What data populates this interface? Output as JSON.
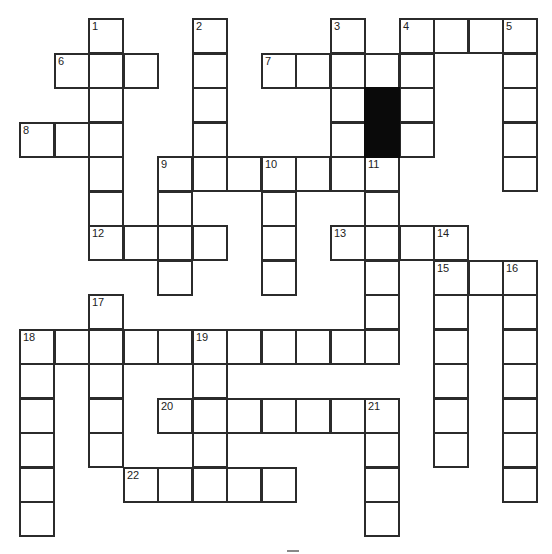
{
  "puzzle": {
    "type": "crossword",
    "grid_origin": {
      "x": 20,
      "y": 19
    },
    "cell_size": 34.5,
    "columns": 15,
    "rows": 15,
    "colors": {
      "border": "#2b2b2b",
      "block": "#0a0a0a",
      "background": "#ffffff"
    },
    "black_cells": [
      [
        2,
        10
      ],
      [
        3,
        10
      ]
    ],
    "entries": [
      {
        "number": "1",
        "direction": "down",
        "row": 0,
        "col": 2,
        "length": 7
      },
      {
        "number": "2",
        "direction": "down",
        "row": 0,
        "col": 5,
        "length": 5
      },
      {
        "number": "3",
        "direction": "down",
        "row": 0,
        "col": 9,
        "length": 4
      },
      {
        "number": "4",
        "direction": "across",
        "row": 0,
        "col": 11,
        "length": 4
      },
      {
        "number": "4",
        "direction": "down",
        "row": 0,
        "col": 11,
        "length": 4
      },
      {
        "number": "5",
        "direction": "down",
        "row": 0,
        "col": 14,
        "length": 5
      },
      {
        "number": "6",
        "direction": "across",
        "row": 1,
        "col": 1,
        "length": 3
      },
      {
        "number": "7",
        "direction": "across",
        "row": 1,
        "col": 7,
        "length": 5
      },
      {
        "number": "8",
        "direction": "across",
        "row": 3,
        "col": 0,
        "length": 3
      },
      {
        "number": "9",
        "direction": "across",
        "row": 4,
        "col": 4,
        "length": 7
      },
      {
        "number": "9",
        "direction": "down",
        "row": 4,
        "col": 4,
        "length": 4
      },
      {
        "number": "10",
        "direction": "down",
        "row": 4,
        "col": 7,
        "length": 4
      },
      {
        "number": "11",
        "direction": "down",
        "row": 4,
        "col": 10,
        "length": 6
      },
      {
        "number": "12",
        "direction": "across",
        "row": 6,
        "col": 2,
        "length": 4
      },
      {
        "number": "13",
        "direction": "across",
        "row": 6,
        "col": 9,
        "length": 4
      },
      {
        "number": "14",
        "direction": "down",
        "row": 6,
        "col": 12,
        "length": 7
      },
      {
        "number": "15",
        "direction": "across",
        "row": 7,
        "col": 12,
        "length": 3
      },
      {
        "number": "16",
        "direction": "down",
        "row": 7,
        "col": 14,
        "length": 7
      },
      {
        "number": "17",
        "direction": "down",
        "row": 8,
        "col": 2,
        "length": 5
      },
      {
        "number": "18",
        "direction": "across",
        "row": 9,
        "col": 0,
        "length": 11
      },
      {
        "number": "18",
        "direction": "down",
        "row": 9,
        "col": 0,
        "length": 6
      },
      {
        "number": "19",
        "direction": "down",
        "row": 9,
        "col": 5,
        "length": 5
      },
      {
        "number": "20",
        "direction": "across",
        "row": 11,
        "col": 4,
        "length": 7
      },
      {
        "number": "21",
        "direction": "down",
        "row": 11,
        "col": 10,
        "length": 4
      },
      {
        "number": "22",
        "direction": "across",
        "row": 13,
        "col": 3,
        "length": 5
      }
    ]
  }
}
